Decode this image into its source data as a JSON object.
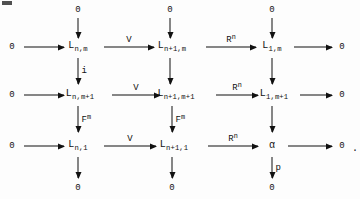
{
  "figure": {
    "kind": "commutative-diagram",
    "trailing_punctuation": ".",
    "zero": "0",
    "rows": [
      {
        "id": "row-1",
        "left_zero": "0",
        "right_zero": "0",
        "objects": [
          {
            "base": "L",
            "sub": "n,m"
          },
          {
            "base": "L",
            "sub": "n+1,m"
          },
          {
            "base": "L",
            "sub": "1,m"
          }
        ],
        "horizontal_labels": [
          "",
          "V",
          "R",
          ""
        ],
        "horizontal_label_sups": [
          "",
          "",
          "n",
          ""
        ]
      },
      {
        "id": "row-2",
        "left_zero": "0",
        "right_zero": "0",
        "objects": [
          {
            "base": "L",
            "sub": "n,m+1"
          },
          {
            "base": "L",
            "sub": "n+1,m+1"
          },
          {
            "base": "L",
            "sub": "1,m+1"
          }
        ],
        "horizontal_labels": [
          "",
          "V",
          "R",
          ""
        ],
        "horizontal_label_sups": [
          "",
          "",
          "n",
          ""
        ]
      },
      {
        "id": "row-3",
        "left_zero": "0",
        "right_zero": "0",
        "objects": [
          {
            "base": "L",
            "sub": "n,1"
          },
          {
            "base": "L",
            "sub": "n+1,1"
          },
          {
            "base": "α",
            "sub": ""
          }
        ],
        "horizontal_labels": [
          "",
          "V",
          "R",
          ""
        ],
        "horizontal_label_sups": [
          "",
          "",
          "n",
          ""
        ]
      }
    ],
    "top_zeros": [
      "0",
      "0",
      "0"
    ],
    "bottom_zeros": [
      "0",
      "0",
      "0"
    ],
    "vertical_labels": {
      "top_to_row1": [
        "",
        "",
        ""
      ],
      "row1_to_row2": [
        "i",
        "",
        ""
      ],
      "row2_to_row3": [
        "F",
        "F",
        ""
      ],
      "row2_to_row3_sup": [
        "m",
        "m",
        ""
      ],
      "row3_to_bottom": [
        "",
        "",
        "p"
      ]
    }
  }
}
